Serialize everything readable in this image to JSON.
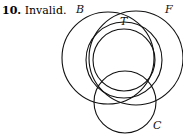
{
  "problem": {
    "number": "10.",
    "answer": "Invalid."
  },
  "diagram": {
    "type": "venn",
    "sets": [
      {
        "label": "B",
        "cx": 108,
        "cy": 58,
        "r": 46
      },
      {
        "label": "F",
        "cx": 136,
        "cy": 58,
        "r": 47
      },
      {
        "label": "T",
        "cx": 124,
        "cy": 58,
        "r": 31
      },
      {
        "label": "C",
        "cx": 125,
        "cy": 101,
        "r": 31
      }
    ],
    "labels": {
      "B": "B",
      "F": "F",
      "T": "T",
      "C": "C"
    }
  }
}
